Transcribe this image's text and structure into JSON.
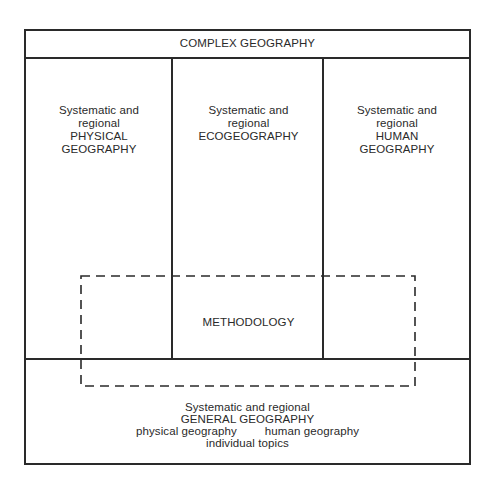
{
  "diagram": {
    "title": "COMPLEX GEOGRAPHY",
    "columns": [
      {
        "lines": [
          "Systematic and",
          "regional",
          "PHYSICAL",
          "GEOGRAPHY"
        ]
      },
      {
        "lines": [
          "Systematic and",
          "regional",
          "ECOGEOGRAPHY"
        ]
      },
      {
        "lines": [
          "Systematic and",
          "regional",
          "HUMAN",
          "GEOGRAPHY"
        ]
      }
    ],
    "overlay": {
      "label": "METHODOLOGY",
      "style": "dashed"
    },
    "base": {
      "line1": "Systematic and regional",
      "line2": "GENERAL GEOGRAPHY",
      "sub_left": "physical geography",
      "sub_right": "human geography",
      "line4": "individual topics"
    },
    "colors": {
      "stroke": "#2a2a2a",
      "background": "#ffffff",
      "text": "#2a2a2a"
    }
  }
}
